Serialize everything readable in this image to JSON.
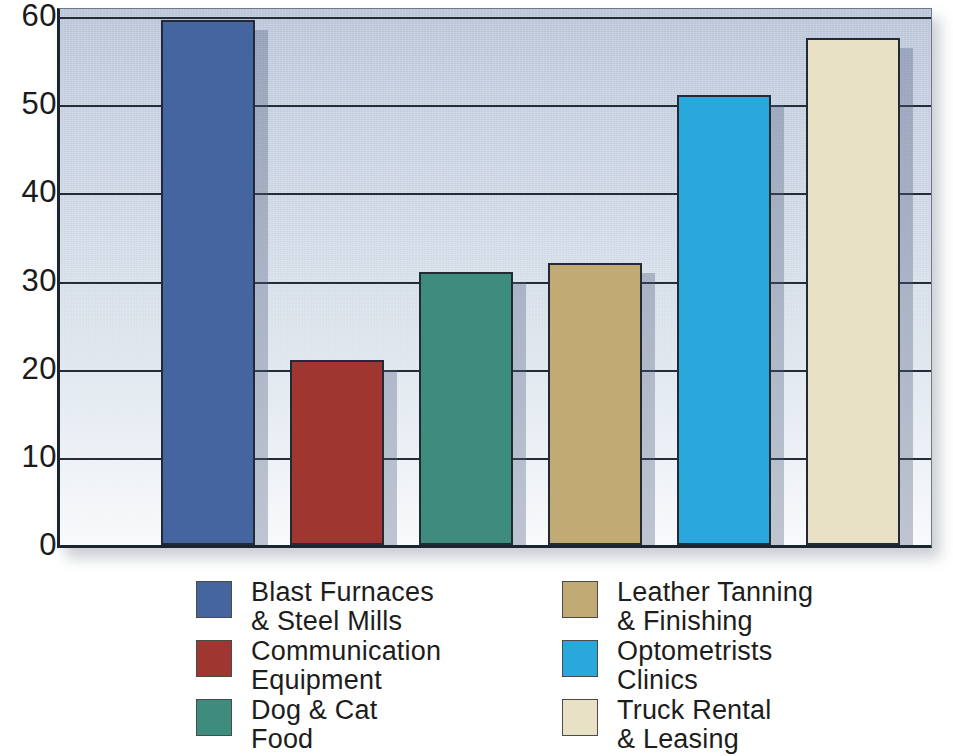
{
  "chart_data": {
    "type": "bar",
    "title": "",
    "xlabel": "",
    "ylabel": "",
    "ylim": [
      0,
      60
    ],
    "grid": true,
    "legend_position": "bottom",
    "y_ticks": [
      0,
      10,
      20,
      30,
      40,
      50,
      60
    ],
    "y_tick_labels": [
      "0",
      "10",
      "20",
      "30",
      "40",
      "50",
      "60"
    ],
    "y_minor_ticks": [
      5,
      15,
      25,
      35,
      45,
      55
    ],
    "categories": [
      "Blast Furnaces & Steel Mills",
      "Communication Equipment",
      "Dog & Cat Food",
      "Leather Tanning & Finishing",
      "Optometrists Clinics",
      "Truck Rental & Leasing"
    ],
    "values": [
      59.5,
      21,
      31,
      32,
      51,
      57.5
    ],
    "colors": [
      "#44659f",
      "#a03630",
      "#3d8c7e",
      "#c2aa75",
      "#29a8dc",
      "#e9e1c5"
    ]
  },
  "legend": {
    "columns": [
      {
        "items": [
          {
            "label": "Blast Furnaces\n& Steel Mills",
            "color": "#44659f"
          },
          {
            "label": "Communication\nEquipment",
            "color": "#a03630"
          },
          {
            "label": "Dog & Cat\nFood",
            "color": "#3d8c7e"
          }
        ]
      },
      {
        "items": [
          {
            "label": "Leather Tanning\n& Finishing",
            "color": "#c2aa75"
          },
          {
            "label": "Optometrists\nClinics",
            "color": "#29a8dc"
          },
          {
            "label": "Truck Rental\n& Leasing",
            "color": "#e9e1c5"
          }
        ]
      }
    ]
  }
}
